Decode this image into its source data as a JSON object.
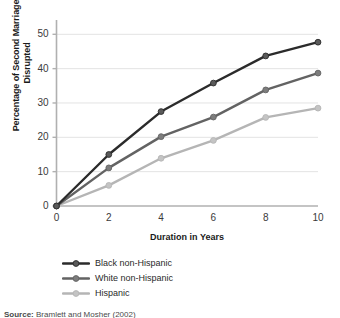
{
  "chart_data": {
    "type": "line",
    "title": "",
    "xlabel": "Duration in Years",
    "ylabel": "Percentage of Second Marriages Disrupted",
    "ylabel_line1": "Percentage of Second Marriages",
    "ylabel_line2": "Disrupted",
    "x": [
      0,
      2,
      4,
      6,
      8,
      10
    ],
    "xticks": [
      "0",
      "2",
      "4",
      "6",
      "8",
      "10"
    ],
    "yticks": [
      "0",
      "10",
      "20",
      "30",
      "40",
      "50"
    ],
    "xlim": [
      0,
      10
    ],
    "ylim": [
      0,
      53
    ],
    "grid": "horizontal",
    "legend_position": "below-axes-left",
    "markers": "circle",
    "series": [
      {
        "name": "Black non-Hispanic",
        "color": "#2b2b2b",
        "marker_color": "#5a5a5a",
        "values": [
          0,
          15.0,
          27.5,
          35.8,
          43.7,
          47.7
        ]
      },
      {
        "name": "White non-Hispanic",
        "color": "#636363",
        "marker_color": "#7d7d7d",
        "values": [
          0,
          11.1,
          20.2,
          25.9,
          33.8,
          38.7
        ]
      },
      {
        "name": "Hispanic",
        "color": "#b5b5b5",
        "marker_color": "#c4c4c4",
        "values": [
          0,
          6.0,
          13.9,
          19.1,
          25.8,
          28.5
        ]
      }
    ]
  },
  "axis": {
    "spine_color": "#b0b0b0",
    "grid_color": "#e3e3e3",
    "tick_text_color": "#3a3a3a"
  },
  "source": {
    "prefix": "Source:",
    "text": "Bramlett and Mosher (2002)"
  }
}
